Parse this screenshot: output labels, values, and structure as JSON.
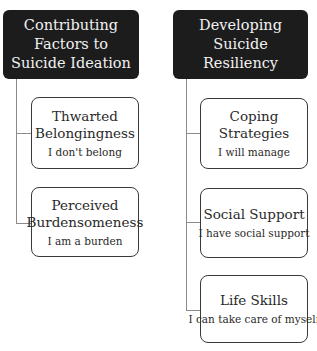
{
  "columns": [
    {
      "header": "Contributing Factors to Suicide Ideation",
      "items": [
        {
          "title": "Thwarted Belongingness",
          "subtitle": "I don't belong"
        },
        {
          "title": "Perceived Burdensomeness",
          "subtitle": "I am a burden"
        }
      ]
    },
    {
      "header": "Developing Suicide Resiliency",
      "items": [
        {
          "title": "Coping Strategies",
          "subtitle": "I will manage"
        },
        {
          "title": "Social Support",
          "subtitle": "I have social support"
        },
        {
          "title": "Life Skills",
          "subtitle": "I can take care of myself"
        }
      ]
    }
  ],
  "colors": {
    "header_bg": "#1c1c1c",
    "header_text": "#f2f2f2",
    "border": "#3a3a3a",
    "connector": "#8a8a8a"
  }
}
